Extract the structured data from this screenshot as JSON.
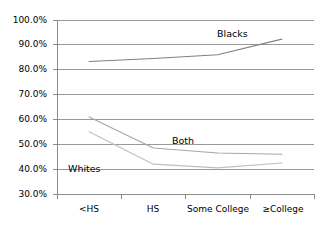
{
  "chart_data": {
    "type": "line",
    "title": "",
    "subtitle": "",
    "xlabel": "",
    "ylabel": "",
    "categories": [
      "<HS",
      "HS",
      "Some College",
      "≥College"
    ],
    "ylim": [
      30,
      100
    ],
    "ytick_values": [
      30,
      40,
      50,
      60,
      70,
      80,
      90,
      100
    ],
    "ytick_labels": [
      "30.0%",
      "40.0%",
      "50.0%",
      "60.0%",
      "70.0%",
      "80.0%",
      "90.0%",
      "100.0%"
    ],
    "grid": true,
    "grid_axis": "y",
    "legend": "inline-annotations",
    "legend_position": "inline",
    "series": [
      {
        "name": "Blacks",
        "color": "#808080",
        "values": [
          83.3,
          84.5,
          86.0,
          92.3
        ],
        "annotation": "Blacks"
      },
      {
        "name": "Both",
        "color": "#a6a6a6",
        "values": [
          61.0,
          48.5,
          46.5,
          46.0
        ],
        "annotation": "Both"
      },
      {
        "name": "Whites",
        "color": "#bfbfbf",
        "values": [
          55.0,
          42.0,
          40.5,
          42.5
        ],
        "annotation": "Whites"
      }
    ],
    "annotations": [
      {
        "text": "Blacks",
        "series": "Blacks"
      },
      {
        "text": "Both",
        "series": "Both"
      },
      {
        "text": "Whites",
        "series": "Whites"
      }
    ]
  },
  "axis": {
    "y_labels": [
      "100.0%",
      "90.0%",
      "80.0%",
      "70.0%",
      "60.0%",
      "50.0%",
      "40.0%",
      "30.0%"
    ],
    "x_labels": [
      "<HS",
      "HS",
      "Some College",
      "≥College"
    ]
  },
  "style": {
    "axis_color": "#808080",
    "grid_color": "#808080",
    "background": "#ffffff",
    "text_color": "#000000"
  }
}
